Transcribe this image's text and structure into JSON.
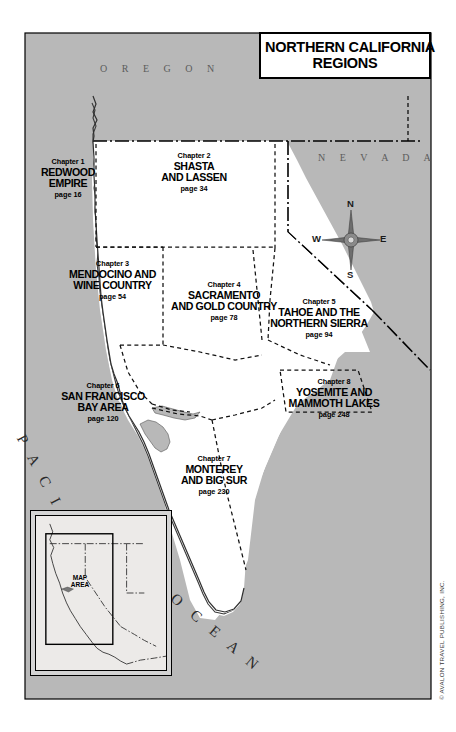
{
  "title": {
    "line1": "NORTHERN CALIFORNIA",
    "line2": "REGIONS"
  },
  "states": {
    "oregon": "O R E G O N",
    "nevada": "N E V A D A"
  },
  "ocean": {
    "pacific": "P A C I F I C",
    "ocean": "O C E A N"
  },
  "compass": {
    "north": "N",
    "south": "S",
    "east": "E",
    "west": "W"
  },
  "inset": {
    "label_line1": "MAP",
    "label_line2": "AREA"
  },
  "copyright": "© AVALON TRAVEL PUBLISHING, INC.",
  "chapters": [
    {
      "number": "Chapter 1",
      "name_line1": "REDWOOD",
      "name_line2": "EMPIRE",
      "page": "page 16"
    },
    {
      "number": "Chapter 2",
      "name_line1": "SHASTA",
      "name_line2": "AND LASSEN",
      "page": "page 34"
    },
    {
      "number": "Chapter 3",
      "name_line1": "MENDOCINO AND",
      "name_line2": "WINE COUNTRY",
      "page": "page 54"
    },
    {
      "number": "Chapter 4",
      "name_line1": "SACRAMENTO",
      "name_line2": "AND GOLD COUNTRY",
      "page": "page 78"
    },
    {
      "number": "Chapter 5",
      "name_line1": "TAHOE AND THE",
      "name_line2": "NORTHERN SIERRA",
      "page": "page 94"
    },
    {
      "number": "Chapter 6",
      "name_line1": "SAN FRANCISCO",
      "name_line2": "BAY AREA",
      "page": "page 120"
    },
    {
      "number": "Chapter 7",
      "name_line1": "MONTEREY",
      "name_line2": "AND BIG SUR",
      "page": "page 230"
    },
    {
      "number": "Chapter 8",
      "name_line1": "YOSEMITE AND",
      "name_line2": "MAMMOTH LAKES",
      "page": "page 248"
    }
  ],
  "colors": {
    "land_outside": "#b8b8b8",
    "california_fill": "#ffffff",
    "water": "#b8b8b8",
    "border_line": "#000000",
    "region_divider": "#000000",
    "state_text": "#5c5c5c"
  }
}
